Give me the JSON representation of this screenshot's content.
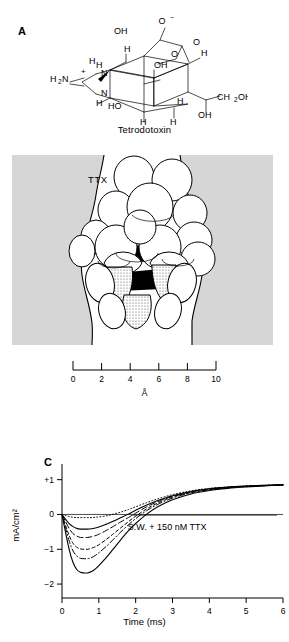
{
  "figure": {
    "panels": [
      {
        "id": "A",
        "label": "A"
      },
      {
        "id": "B",
        "label": "B"
      },
      {
        "id": "C",
        "label": "C"
      }
    ]
  },
  "panel_a": {
    "label": "A",
    "caption": "Tetrodotoxin",
    "atom_labels": [
      {
        "text": "O",
        "sup": "−"
      },
      {
        "text": "OH"
      },
      {
        "text": "O"
      },
      {
        "text": "O"
      },
      {
        "text": "H"
      },
      {
        "text": "H"
      },
      {
        "text": "H"
      },
      {
        "text": "H"
      },
      {
        "text": "OH"
      },
      {
        "text": "H"
      },
      {
        "text": "N"
      },
      {
        "text": "N"
      },
      {
        "text": "H"
      },
      {
        "text": "H"
      },
      {
        "text": "H₂N"
      },
      {
        "text": "+"
      },
      {
        "text": "HO"
      },
      {
        "text": "H"
      },
      {
        "text": "H"
      },
      {
        "text": "H"
      },
      {
        "text": "CH₂OH"
      },
      {
        "text": "OH"
      }
    ]
  },
  "panel_b": {
    "label": "B",
    "molecule_label": "TTX",
    "membrane_color": "#d6d6d6",
    "scale": {
      "unit": "Å",
      "ticks": [
        "0",
        "2",
        "4",
        "6",
        "8",
        "10"
      ],
      "min": 0,
      "max": 10
    }
  },
  "panel_c": {
    "label": "C",
    "annotation": "S.W. + 150 nM TTX"
  },
  "chart_data": {
    "type": "line",
    "title": "",
    "xlabel": "Time (ms)",
    "ylabel": "mA/cm²",
    "xlim": [
      0,
      6
    ],
    "ylim": [
      -2.4,
      1.45
    ],
    "xticks": [
      0,
      1,
      2,
      3,
      4,
      5,
      6
    ],
    "xticklabels": [
      "0",
      "1",
      "2",
      "3",
      "4",
      "5",
      "6"
    ],
    "yticks": [
      1,
      0,
      -1,
      -2
    ],
    "yticklabels": [
      "+1",
      "0",
      "−1",
      "−2"
    ],
    "grid": false,
    "legend": false,
    "annotations": [
      {
        "text": "S.W. + 150 nM TTX",
        "x": 3.2,
        "y": -0.38
      }
    ],
    "x": [
      0,
      0.1,
      0.2,
      0.3,
      0.4,
      0.5,
      0.6,
      0.7,
      0.8,
      0.9,
      1.0,
      1.2,
      1.4,
      1.6,
      1.8,
      2.0,
      2.3,
      2.6,
      3.0,
      3.5,
      4.0,
      4.5,
      5.0,
      5.5,
      6.0
    ],
    "series": [
      {
        "name": "trace-1",
        "style": "dotted",
        "peak_value": -0.09,
        "peak_time": 0.8,
        "values": [
          0,
          -0.03,
          -0.06,
          -0.08,
          -0.09,
          -0.09,
          -0.09,
          -0.09,
          -0.09,
          -0.08,
          -0.07,
          -0.04,
          0.01,
          0.07,
          0.14,
          0.22,
          0.34,
          0.45,
          0.57,
          0.68,
          0.75,
          0.79,
          0.82,
          0.84,
          0.85
        ]
      },
      {
        "name": "trace-2",
        "style": "solid",
        "peak_value": -0.42,
        "peak_time": 0.72,
        "values": [
          0,
          -0.14,
          -0.27,
          -0.35,
          -0.4,
          -0.42,
          -0.42,
          -0.42,
          -0.41,
          -0.39,
          -0.36,
          -0.28,
          -0.19,
          -0.09,
          0.01,
          0.12,
          0.27,
          0.4,
          0.54,
          0.66,
          0.74,
          0.79,
          0.82,
          0.84,
          0.85
        ]
      },
      {
        "name": "trace-3",
        "style": "dashed-long",
        "peak_value": -0.66,
        "peak_time": 0.72,
        "values": [
          0,
          -0.21,
          -0.41,
          -0.55,
          -0.62,
          -0.66,
          -0.66,
          -0.66,
          -0.64,
          -0.61,
          -0.57,
          -0.46,
          -0.34,
          -0.21,
          -0.09,
          0.04,
          0.22,
          0.37,
          0.52,
          0.65,
          0.73,
          0.78,
          0.81,
          0.83,
          0.85
        ]
      },
      {
        "name": "trace-4",
        "style": "dashed-short",
        "peak_value": -1.0,
        "peak_time": 0.7,
        "values": [
          0,
          -0.32,
          -0.62,
          -0.83,
          -0.94,
          -0.99,
          -1.0,
          -1.0,
          -0.97,
          -0.93,
          -0.87,
          -0.72,
          -0.55,
          -0.38,
          -0.21,
          -0.05,
          0.16,
          0.33,
          0.5,
          0.63,
          0.72,
          0.77,
          0.81,
          0.83,
          0.85
        ]
      },
      {
        "name": "trace-5",
        "style": "dash-dot",
        "peak_value": -1.27,
        "peak_time": 0.7,
        "values": [
          0,
          -0.4,
          -0.78,
          -1.05,
          -1.19,
          -1.26,
          -1.27,
          -1.27,
          -1.24,
          -1.18,
          -1.1,
          -0.92,
          -0.71,
          -0.5,
          -0.3,
          -0.12,
          0.11,
          0.29,
          0.47,
          0.62,
          0.71,
          0.77,
          0.8,
          0.83,
          0.85
        ]
      },
      {
        "name": "trace-6",
        "style": "solid",
        "peak_value": -1.68,
        "peak_time": 0.7,
        "values": [
          0,
          -0.53,
          -1.03,
          -1.38,
          -1.58,
          -1.66,
          -1.68,
          -1.68,
          -1.64,
          -1.57,
          -1.47,
          -1.24,
          -0.98,
          -0.72,
          -0.47,
          -0.26,
          0.01,
          0.22,
          0.42,
          0.59,
          0.69,
          0.75,
          0.79,
          0.82,
          0.85
        ]
      }
    ]
  }
}
